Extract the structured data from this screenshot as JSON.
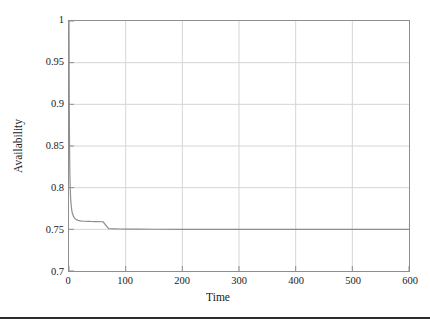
{
  "figure": {
    "background_color": "#ffffff",
    "frame_color": "#8e8e8e",
    "grid_color": "#d5d5d5",
    "curve_color": "#8e8e8e",
    "rule_color": "#2b2b2b"
  },
  "chart_data": {
    "type": "line",
    "title": "",
    "subtitle": "",
    "xlabel": "Time",
    "ylabel": "Availability",
    "xlim": [
      0,
      600
    ],
    "ylim": [
      0.7,
      1
    ],
    "xticks": [
      0,
      100,
      200,
      300,
      400,
      500,
      600
    ],
    "xtick_labels": [
      "0",
      "100",
      "200",
      "300",
      "400",
      "500",
      "600"
    ],
    "yticks": [
      0.7,
      0.75,
      0.8,
      0.85,
      0.9,
      0.95,
      1
    ],
    "ytick_labels": [
      "0.7",
      "0.75",
      "0.8",
      "0.85",
      "0.9",
      "0.95",
      "1"
    ],
    "grid": true,
    "legend": null,
    "annotations": [],
    "asymptote": 0.75,
    "series": [
      {
        "name": "Availability",
        "color": "#8e8e8e",
        "x": [
          0,
          0.5,
          1,
          1.5,
          2,
          2.5,
          3,
          4,
          5,
          6,
          7,
          8,
          9,
          10,
          12,
          14,
          16,
          18,
          20,
          24,
          28,
          32,
          36,
          40,
          45,
          50,
          60,
          70,
          80,
          90,
          100,
          120,
          150,
          200,
          250,
          300,
          350,
          400,
          450,
          500,
          550,
          600
        ],
        "y": [
          1,
          0.9,
          0.845,
          0.818,
          0.803,
          0.793,
          0.786,
          0.7775,
          0.7725,
          0.7693,
          0.7671,
          0.7655,
          0.7643,
          0.7634,
          0.7621,
          0.7613,
          0.7608,
          0.7605,
          0.7602,
          0.7599,
          0.7597,
          0.7596,
          0.7595,
          0.7594,
          0.7593,
          0.7592,
          0.7591,
          0.7509,
          0.7506,
          0.7504,
          0.7503,
          0.7502,
          0.7501,
          0.75,
          0.75,
          0.75,
          0.75,
          0.75,
          0.75,
          0.75,
          0.75,
          0.75
        ]
      }
    ]
  }
}
